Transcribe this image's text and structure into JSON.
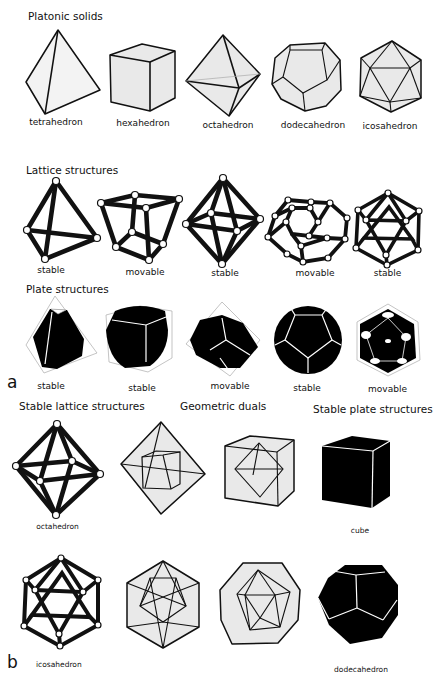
{
  "panel_a": {
    "letter": "a",
    "sections": {
      "platonic": {
        "title": "Platonic solids",
        "items": [
          {
            "name": "tetrahedron"
          },
          {
            "name": "hexahedron"
          },
          {
            "name": "octahedron"
          },
          {
            "name": "dodecahedron"
          },
          {
            "name": "icosahedron"
          }
        ]
      },
      "lattice": {
        "title": "Lattice structures",
        "items": [
          {
            "shape": "tetrahedron",
            "label": "stable"
          },
          {
            "shape": "hexahedron",
            "label": "movable"
          },
          {
            "shape": "octahedron",
            "label": "stable"
          },
          {
            "shape": "dodecahedron",
            "label": "movable"
          },
          {
            "shape": "icosahedron",
            "label": "stable"
          }
        ]
      },
      "plate": {
        "title": "Plate structures",
        "items": [
          {
            "shape": "tetrahedron",
            "label": "stable"
          },
          {
            "shape": "hexahedron",
            "label": "stable"
          },
          {
            "shape": "octahedron",
            "label": "movable"
          },
          {
            "shape": "dodecahedron",
            "label": "stable"
          },
          {
            "shape": "icosahedron",
            "label": "movable"
          }
        ]
      }
    }
  },
  "panel_b": {
    "letter": "b",
    "columns": {
      "stable_lattice": "Stable lattice structures",
      "geometric_duals": "Geometric duals",
      "stable_plate": "Stable plate structures"
    },
    "rows": [
      {
        "lattice_label": "octahedron",
        "duals": [
          "octahedron containing cube",
          "cube containing octahedron"
        ],
        "plate_label": "cube"
      },
      {
        "lattice_label": "icosahedron",
        "duals": [
          "icosahedron containing dodecahedron",
          "dodecahedron containing icosahedron"
        ],
        "plate_label": "dodecahedron"
      }
    ]
  },
  "colors": {
    "line": "#111111",
    "face_fill": "#e9e9e9",
    "plate_fill": "#000000",
    "background": "#ffffff"
  }
}
